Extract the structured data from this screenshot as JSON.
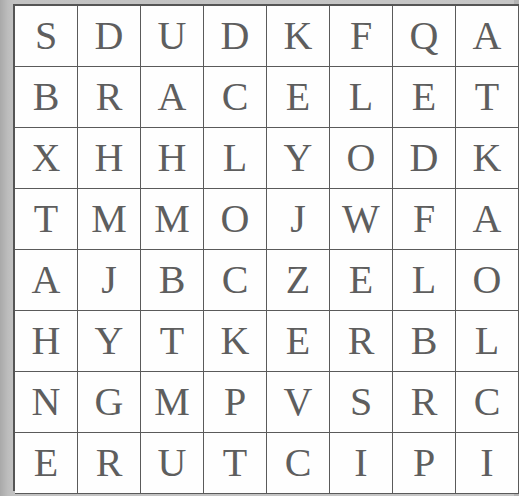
{
  "puzzle": {
    "type": "word-search",
    "rows": 8,
    "cols": 8,
    "grid": [
      [
        "S",
        "D",
        "U",
        "D",
        "K",
        "F",
        "Q",
        "A"
      ],
      [
        "B",
        "R",
        "A",
        "C",
        "E",
        "L",
        "E",
        "T"
      ],
      [
        "X",
        "H",
        "H",
        "L",
        "Y",
        "O",
        "D",
        "K"
      ],
      [
        "T",
        "M",
        "M",
        "O",
        "J",
        "W",
        "F",
        "A"
      ],
      [
        "A",
        "J",
        "B",
        "C",
        "Z",
        "E",
        "L",
        "O"
      ],
      [
        "H",
        "Y",
        "T",
        "K",
        "E",
        "R",
        "B",
        "L"
      ],
      [
        "N",
        "G",
        "M",
        "P",
        "V",
        "S",
        "R",
        "C"
      ],
      [
        "E",
        "R",
        "U",
        "T",
        "C",
        "I",
        "P",
        "I"
      ]
    ]
  },
  "colors": {
    "background": "#b4b4b4",
    "cell_background": "#fefefe",
    "grid_line": "#5a5a5a",
    "letter": "#5e5e5e"
  }
}
